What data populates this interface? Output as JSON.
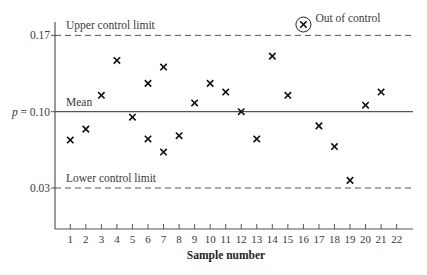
{
  "chart_data": {
    "type": "scatter",
    "title": "",
    "xlabel": "Sample number",
    "ylabel": "",
    "xlim": [
      0.5,
      23
    ],
    "ylim": [
      0.0,
      0.18
    ],
    "x_ticks": [
      1,
      2,
      3,
      4,
      5,
      6,
      7,
      8,
      9,
      10,
      11,
      12,
      13,
      14,
      15,
      16,
      17,
      18,
      19,
      20,
      21,
      22
    ],
    "y_ticks": [
      {
        "value": 0.17,
        "label": "0.17"
      },
      {
        "value": 0.1,
        "label": "p = 0.10"
      },
      {
        "value": 0.03,
        "label": "0.03"
      }
    ],
    "reference_lines": [
      {
        "name": "Upper control limit",
        "value": 0.17,
        "style": "dashed"
      },
      {
        "name": "Mean",
        "value": 0.1,
        "style": "solid"
      },
      {
        "name": "Lower control limit",
        "value": 0.03,
        "style": "dashed"
      }
    ],
    "series": [
      {
        "name": "Sample proportion",
        "marker": "x",
        "points": [
          {
            "x": 1,
            "y": 0.074
          },
          {
            "x": 2,
            "y": 0.084
          },
          {
            "x": 3,
            "y": 0.115
          },
          {
            "x": 4,
            "y": 0.147
          },
          {
            "x": 5,
            "y": 0.095
          },
          {
            "x": 6,
            "y": 0.126
          },
          {
            "x": 6,
            "y": 0.075
          },
          {
            "x": 7,
            "y": 0.141
          },
          {
            "x": 7,
            "y": 0.063
          },
          {
            "x": 8,
            "y": 0.078
          },
          {
            "x": 9,
            "y": 0.108
          },
          {
            "x": 10,
            "y": 0.126
          },
          {
            "x": 11,
            "y": 0.118
          },
          {
            "x": 12,
            "y": 0.1
          },
          {
            "x": 13,
            "y": 0.075
          },
          {
            "x": 14,
            "y": 0.151
          },
          {
            "x": 15,
            "y": 0.115
          },
          {
            "x": 16,
            "y": 0.18,
            "out_of_control": true
          },
          {
            "x": 17,
            "y": 0.087
          },
          {
            "x": 18,
            "y": 0.068
          },
          {
            "x": 19,
            "y": 0.037
          },
          {
            "x": 20,
            "y": 0.106
          },
          {
            "x": 21,
            "y": 0.118
          }
        ]
      }
    ],
    "annotations": [
      {
        "text": "Out of control",
        "x": 16,
        "y": 0.18
      }
    ],
    "grid": false,
    "legend": "none"
  },
  "labels": {
    "ucl": "Upper control limit",
    "mean": "Mean",
    "lcl": "Lower control limit",
    "out_of_control": "Out of control",
    "x_title": "Sample number"
  }
}
